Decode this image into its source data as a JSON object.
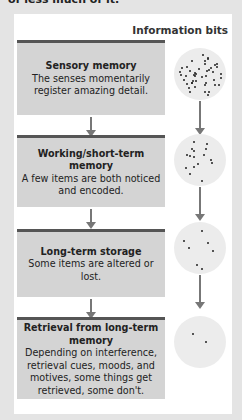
{
  "caption": "of less much of it.",
  "column_header": "Information bits",
  "stages": [
    {
      "title": "Sensory memory",
      "body": "The senses momentarily register amazing detail.",
      "dots": 45
    },
    {
      "title": "Working/short-term memory",
      "body": "A few items are both noticed and encoded.",
      "dots": 16
    },
    {
      "title": "Long-term storage",
      "body": "Some items are altered or lost.",
      "dots": 7
    },
    {
      "title": "Retrieval from long-term memory",
      "body": "Depending on interference, retrieval cues, moods, and motives, some things get retrieved, some don't.",
      "dots": 2
    }
  ]
}
